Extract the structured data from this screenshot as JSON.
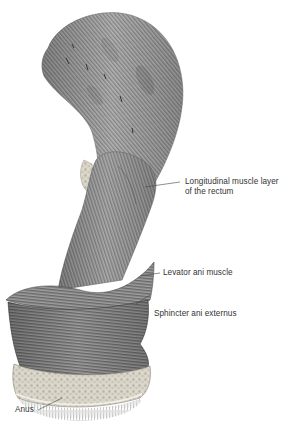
{
  "figure": {
    "colors": {
      "muscle_light": "#b8b8b8",
      "muscle_mid": "#8a8a8a",
      "muscle_dark": "#4a4a4a",
      "fat_tissue": "#d6d2c6",
      "leader_line": "#444444",
      "text": "#333333",
      "background": "#ffffff"
    }
  },
  "labels": {
    "longitudinal": {
      "line1": "Longitudinal muscle layer",
      "line2": "of the rectum"
    },
    "levator": {
      "text": "Levator ani muscle"
    },
    "sphincter": {
      "text": "Sphincter ani externus"
    },
    "anus": {
      "text": "Anus"
    }
  }
}
